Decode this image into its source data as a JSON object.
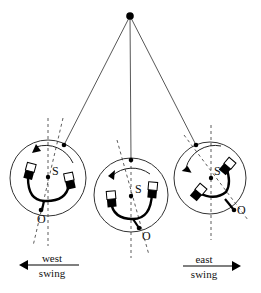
{
  "diagram": {
    "pivot": {
      "x": 130,
      "y": 16
    },
    "pendulums": [
      {
        "id": "west",
        "cx": 48,
        "cy": 178,
        "r": 38,
        "attach": {
          "x": 64,
          "y": 145
        },
        "s_label": "S",
        "o_label": "O",
        "o_point": {
          "x": 41,
          "y": 210
        },
        "tilt": -12
      },
      {
        "id": "center",
        "cx": 131,
        "cy": 195,
        "r": 37,
        "attach": {
          "x": 131,
          "y": 160
        },
        "s_label": "S",
        "o_label": "O",
        "o_point": {
          "x": 139,
          "y": 228
        },
        "tilt": 14
      },
      {
        "id": "east",
        "cx": 210,
        "cy": 178,
        "r": 36,
        "attach": {
          "x": 196,
          "y": 145
        },
        "s_label": "S",
        "o_label": "O",
        "o_point": {
          "x": 234,
          "y": 210
        },
        "tilt": 40
      }
    ],
    "labels": {
      "west_top": "west",
      "west_bottom": "swing",
      "east_top": "east",
      "east_bottom": "swing",
      "s": "S",
      "o": "O"
    }
  }
}
